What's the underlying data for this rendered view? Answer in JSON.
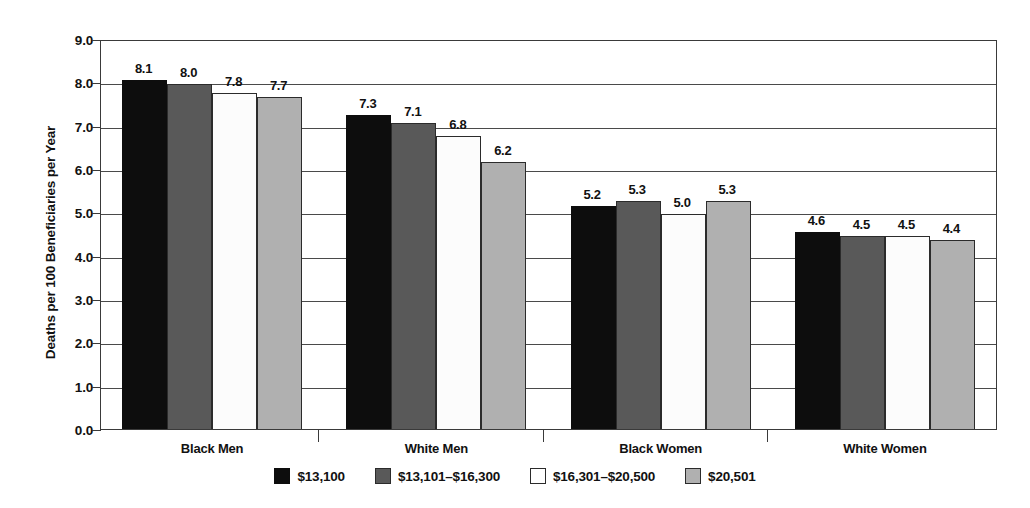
{
  "chart_data": {
    "type": "bar",
    "title": "",
    "xlabel": "",
    "ylabel": "Deaths per 100 Beneficiaries per Year",
    "ylim": [
      0.0,
      9.0
    ],
    "ytick_labels": [
      "0.0",
      "1.0",
      "2.0",
      "3.0",
      "4.0",
      "5.0",
      "6.0",
      "7.0",
      "8.0",
      "9.0"
    ],
    "ytick_values": [
      0.0,
      1.0,
      2.0,
      3.0,
      4.0,
      5.0,
      6.0,
      7.0,
      8.0,
      9.0
    ],
    "grid": true,
    "legend_position": "bottom-center",
    "categories": [
      "Black Men",
      "White Men",
      "Black Women",
      "White Women"
    ],
    "series": [
      {
        "name": "$13,100",
        "color": "#0d0d0d",
        "values": [
          8.1,
          7.3,
          5.2,
          4.6
        ],
        "labels": [
          "8.1",
          "7.3",
          "5.2",
          "4.6"
        ]
      },
      {
        "name": "$13,101–$16,300",
        "color": "#595959",
        "values": [
          8.0,
          7.1,
          5.3,
          4.5
        ],
        "labels": [
          "8.0",
          "7.1",
          "5.3",
          "4.5"
        ]
      },
      {
        "name": "$16,301–$20,500",
        "color": "#ffffff",
        "values": [
          7.8,
          6.8,
          5.0,
          4.5
        ],
        "labels": [
          "7.8",
          "6.8",
          "5.0",
          "4.5"
        ]
      },
      {
        "name": "$20,501",
        "color": "#b0b0b0",
        "values": [
          7.7,
          6.2,
          5.3,
          4.4
        ],
        "labels": [
          "7.7",
          "6.2",
          "5.3",
          "4.4"
        ]
      }
    ]
  }
}
